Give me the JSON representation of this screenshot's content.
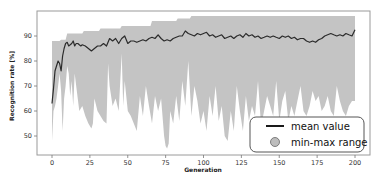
{
  "chart_data": {
    "type": "line",
    "title": "",
    "xlabel": "Generation",
    "ylabel": "Recognition rate [%]",
    "xlim": [
      -8,
      210
    ],
    "ylim": [
      42,
      99
    ],
    "xticks": [
      0,
      25,
      50,
      75,
      100,
      125,
      150,
      175,
      200
    ],
    "yticks": [
      50,
      60,
      70,
      80,
      90
    ],
    "grid": false,
    "legend_position": "lower right",
    "legend": [
      "mean value",
      "min-max range"
    ],
    "colors": {
      "mean": "#2b2b2b",
      "range": "#c4c4c4",
      "frame": "#9a9a9a"
    },
    "series": [
      {
        "name": "mean value",
        "type": "line",
        "x": [
          0,
          1,
          2,
          3,
          4,
          5,
          6,
          7,
          8,
          9,
          10,
          11,
          12,
          13,
          14,
          15,
          16,
          17,
          18,
          19,
          20,
          22,
          24,
          26,
          28,
          30,
          32,
          34,
          36,
          38,
          40,
          42,
          44,
          46,
          48,
          50,
          52,
          54,
          56,
          58,
          60,
          62,
          64,
          66,
          68,
          70,
          72,
          74,
          76,
          78,
          80,
          82,
          84,
          86,
          88,
          90,
          92,
          94,
          96,
          98,
          100,
          102,
          104,
          106,
          108,
          110,
          112,
          114,
          116,
          118,
          120,
          122,
          124,
          126,
          128,
          130,
          132,
          134,
          136,
          138,
          140,
          142,
          144,
          146,
          148,
          150,
          152,
          154,
          156,
          158,
          160,
          162,
          164,
          166,
          168,
          170,
          172,
          174,
          176,
          178,
          180,
          182,
          184,
          186,
          188,
          190,
          192,
          194,
          196,
          198,
          200
        ],
        "values": [
          63,
          69,
          76,
          78,
          80,
          79,
          76,
          82,
          85,
          87,
          87.5,
          86,
          86.5,
          87,
          88,
          86,
          87,
          87,
          86.5,
          86,
          86.5,
          86,
          85,
          84,
          85,
          86,
          86,
          87,
          86,
          89,
          88,
          89,
          87,
          89,
          90,
          87,
          88,
          88,
          87.5,
          88,
          88.5,
          88,
          89,
          89.5,
          89,
          90.5,
          89,
          88,
          88.5,
          88,
          89,
          89.5,
          90,
          90,
          92,
          91,
          90.5,
          90,
          91,
          90.5,
          91,
          91.5,
          90,
          90.5,
          89.5,
          90,
          90.5,
          89,
          89.5,
          90,
          89,
          90,
          90.5,
          89.5,
          91,
          90,
          90.5,
          89.5,
          90,
          89,
          89.5,
          90,
          89.5,
          90,
          89.5,
          89,
          90,
          89.5,
          90,
          89,
          89.5,
          88.5,
          89,
          89,
          88,
          87.5,
          88,
          87.5,
          88.5,
          89,
          90,
          90.5,
          91,
          90.5,
          90,
          90.5,
          90,
          91,
          90.5,
          90,
          92.5
        ]
      },
      {
        "name": "min-max range (max)",
        "type": "area_upper",
        "x": [
          0,
          5,
          6,
          9,
          10,
          20,
          21,
          31,
          32,
          45,
          46,
          65,
          66,
          82,
          83,
          91,
          92,
          199,
          200
        ],
        "values": [
          88,
          88,
          88.5,
          88.5,
          91,
          91,
          92,
          92,
          93,
          93,
          94,
          94,
          96,
          96,
          97,
          97,
          98,
          98,
          98
        ]
      },
      {
        "name": "min-max range (min)",
        "type": "area_lower",
        "x": [
          0,
          1,
          2,
          3,
          4,
          5,
          6,
          7,
          8,
          9,
          10,
          11,
          12,
          13,
          14,
          15,
          16,
          18,
          20,
          22,
          24,
          25,
          26,
          27,
          28,
          30,
          32,
          34,
          36,
          37,
          38,
          40,
          42,
          44,
          46,
          47,
          48,
          50,
          52,
          54,
          56,
          58,
          60,
          62,
          64,
          66,
          68,
          70,
          72,
          74,
          75,
          76,
          77,
          78,
          80,
          82,
          84,
          86,
          88,
          90,
          92,
          94,
          96,
          98,
          100,
          102,
          104,
          106,
          108,
          110,
          112,
          114,
          116,
          118,
          120,
          122,
          124,
          126,
          128,
          130,
          132,
          134,
          136,
          138,
          140,
          142,
          144,
          146,
          148,
          150,
          152,
          154,
          156,
          158,
          160,
          162,
          164,
          166,
          168,
          170,
          172,
          174,
          176,
          178,
          180,
          182,
          184,
          186,
          188,
          190,
          192,
          194,
          196,
          198,
          200
        ],
        "values": [
          48,
          60,
          62,
          65,
          70,
          75,
          68,
          52,
          65,
          70,
          78,
          75,
          66,
          72,
          62,
          75,
          70,
          60,
          62,
          58,
          55,
          54,
          53,
          55,
          65,
          60,
          58,
          56,
          55,
          79,
          70,
          62,
          65,
          60,
          83,
          62,
          72,
          60,
          58,
          55,
          52,
          66,
          58,
          70,
          62,
          55,
          66,
          60,
          65,
          50,
          46,
          45,
          47,
          60,
          55,
          66,
          56,
          72,
          62,
          80,
          58,
          70,
          64,
          55,
          60,
          52,
          66,
          58,
          70,
          56,
          62,
          50,
          48,
          60,
          52,
          70,
          60,
          52,
          66,
          56,
          62,
          58,
          72,
          54,
          60,
          66,
          62,
          58,
          72,
          56,
          64,
          68,
          56,
          62,
          58,
          64,
          70,
          60,
          58,
          62,
          68,
          64,
          66,
          60,
          62,
          66,
          60,
          58,
          70,
          64,
          60,
          58,
          62,
          64,
          64
        ]
      }
    ]
  }
}
